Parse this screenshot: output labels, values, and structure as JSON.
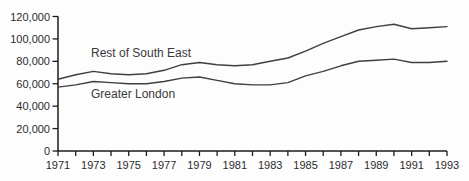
{
  "chart_data": {
    "type": "line",
    "title": "",
    "xlabel": "",
    "ylabel": "",
    "x": [
      1971,
      1972,
      1973,
      1974,
      1975,
      1976,
      1977,
      1978,
      1979,
      1980,
      1981,
      1982,
      1983,
      1984,
      1985,
      1986,
      1987,
      1988,
      1989,
      1990,
      1991,
      1992,
      1993
    ],
    "series": [
      {
        "name": "Rest of South East",
        "values": [
          64000,
          68000,
          71000,
          69000,
          68000,
          69000,
          72000,
          77000,
          79000,
          77000,
          76000,
          77000,
          80000,
          83000,
          89000,
          96000,
          102000,
          108000,
          111000,
          113000,
          109000,
          110000,
          111000
        ]
      },
      {
        "name": "Greater London",
        "values": [
          57000,
          59000,
          62000,
          61000,
          60000,
          60000,
          62000,
          65000,
          66000,
          63000,
          60000,
          59000,
          59000,
          61000,
          67000,
          71000,
          76000,
          80000,
          81000,
          82000,
          79000,
          79000,
          80000
        ]
      }
    ],
    "ylim": [
      0,
      120000
    ],
    "ytick_interval": 20000,
    "y_tick_labels": [
      "0",
      "20,000",
      "40,000",
      "60,000",
      "80,000",
      "100,000",
      "120,000"
    ],
    "x_tick_labels": [
      "1971",
      "1973",
      "1975",
      "1977",
      "1979",
      "1981",
      "1983",
      "1985",
      "1987",
      "1989",
      "1991",
      "1993"
    ],
    "grid": false,
    "legend_position": "labels-on-chart",
    "colors": {
      "line": "#3f3f3f",
      "axis": "#1c1c1c",
      "text": "#2c2c2c",
      "background": "#fdfdfd"
    }
  }
}
